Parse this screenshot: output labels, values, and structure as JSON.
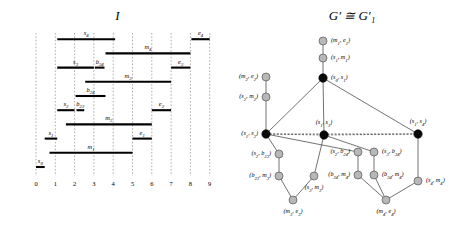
{
  "figure": {
    "interval_panel": {
      "title": "I"
    },
    "graph_panel": {
      "title": "G′ ≅ G′₁"
    }
  },
  "chart_data": {
    "type": "table",
    "xlabel": "",
    "ylabel": "",
    "grid": true,
    "axis": {
      "ticks": [
        "0",
        "1",
        "2",
        "3",
        "4",
        "5",
        "6",
        "7",
        "8",
        "9"
      ],
      "xlim": [
        0,
        9
      ]
    },
    "intervals": [
      {
        "label": "s₀",
        "start": 0.0,
        "end": 0.45,
        "row": 0
      },
      {
        "label": "m₁",
        "start": 0.7,
        "end": 5.0,
        "row": 1
      },
      {
        "label": "s₁",
        "start": 0.45,
        "end": 1.1,
        "row": 2
      },
      {
        "label": "e₁",
        "start": 5.0,
        "end": 6.0,
        "row": 2
      },
      {
        "label": "m₂",
        "start": 1.55,
        "end": 6.0,
        "row": 3
      },
      {
        "label": "s₂",
        "start": 1.1,
        "end": 2.0,
        "row": 4
      },
      {
        "label": "b₂₃",
        "start": 2.1,
        "end": 2.5,
        "row": 4
      },
      {
        "label": "e₂",
        "start": 6.0,
        "end": 7.0,
        "row": 4
      },
      {
        "label": "b₂₄",
        "start": 2.05,
        "end": 3.6,
        "row": 5
      },
      {
        "label": "m₃",
        "start": 2.55,
        "end": 7.0,
        "row": 6
      },
      {
        "label": "s₃",
        "start": 1.1,
        "end": 3.0,
        "row": 7
      },
      {
        "label": "b₃₄",
        "start": 3.05,
        "end": 3.55,
        "row": 7
      },
      {
        "label": "e₃",
        "start": 7.0,
        "end": 8.0,
        "row": 7
      },
      {
        "label": "m₄",
        "start": 3.6,
        "end": 8.0,
        "row": 8
      },
      {
        "label": "s₄",
        "start": 1.1,
        "end": 4.1,
        "row": 9
      },
      {
        "label": "e₄",
        "start": 8.05,
        "end": 9.0,
        "row": 9
      }
    ],
    "nodes": [
      {
        "id": "s0s1",
        "label": "(s₀, s₁)",
        "kind": "black",
        "x": 88,
        "y": 78,
        "label_pos": "right"
      },
      {
        "id": "s1m1",
        "label": "(s₁, m₁)",
        "kind": "gray",
        "x": 88,
        "y": 58,
        "label_pos": "right"
      },
      {
        "id": "m1e1",
        "label": "(m₁, e₁)",
        "kind": "gray",
        "x": 88,
        "y": 41,
        "label_pos": "right"
      },
      {
        "id": "s1s2",
        "label": "(s₁, s₂)",
        "kind": "black",
        "x": 31,
        "y": 134,
        "label_pos": "left"
      },
      {
        "id": "s2m2",
        "label": "(s₂, m₂)",
        "kind": "gray",
        "x": 31,
        "y": 97,
        "label_pos": "left"
      },
      {
        "id": "m2e2",
        "label": "(m₂, e₂)",
        "kind": "gray",
        "x": 31,
        "y": 77,
        "label_pos": "left"
      },
      {
        "id": "s1s3",
        "label": "(s₁, s₃)",
        "kind": "black",
        "x": 89,
        "y": 135,
        "label_pos": "above"
      },
      {
        "id": "s1s4",
        "label": "(s₁, s₄)",
        "kind": "black",
        "x": 183,
        "y": 134,
        "label_pos": "above"
      },
      {
        "id": "s2b23",
        "label": "(s₂, b₂₃)",
        "kind": "gray",
        "x": 44,
        "y": 154,
        "label_pos": "left"
      },
      {
        "id": "b23m3",
        "label": "(b₂₃, m₃)",
        "kind": "gray",
        "x": 44,
        "y": 176,
        "label_pos": "left"
      },
      {
        "id": "s3m3",
        "label": "(s₃, m₃)",
        "kind": "gray",
        "x": 79,
        "y": 176,
        "label_pos": "below"
      },
      {
        "id": "m3e3",
        "label": "(m₃, e₃)",
        "kind": "gray",
        "x": 58,
        "y": 200,
        "label_pos": "below"
      },
      {
        "id": "s2b24",
        "label": "(s₂, b₂₄)",
        "kind": "gray",
        "x": 123,
        "y": 152,
        "label_pos": "left"
      },
      {
        "id": "b24m4",
        "label": "(b₂₄, m₄)",
        "kind": "gray",
        "x": 123,
        "y": 175,
        "label_pos": "left"
      },
      {
        "id": "s3b34",
        "label": "(s₃, b₃₄)",
        "kind": "gray",
        "x": 139,
        "y": 152,
        "label_pos": "right"
      },
      {
        "id": "b34m4",
        "label": "(b₃₄, m₄)",
        "kind": "gray",
        "x": 139,
        "y": 175,
        "label_pos": "right"
      },
      {
        "id": "m4e4",
        "label": "(m₄, e₄)",
        "kind": "gray",
        "x": 151,
        "y": 200,
        "label_pos": "below"
      },
      {
        "id": "s4m4",
        "label": "(s₄, m₄)",
        "kind": "gray",
        "x": 183,
        "y": 181,
        "label_pos": "right"
      }
    ],
    "edges": [
      {
        "from": "m1e1",
        "to": "s1m1",
        "style": "solid"
      },
      {
        "from": "s1m1",
        "to": "s0s1",
        "style": "solid"
      },
      {
        "from": "s0s1",
        "to": "s1s2",
        "style": "solid"
      },
      {
        "from": "s0s1",
        "to": "s1s3",
        "style": "solid"
      },
      {
        "from": "s0s1",
        "to": "s1s4",
        "style": "solid"
      },
      {
        "from": "m2e2",
        "to": "s2m2",
        "style": "solid"
      },
      {
        "from": "s2m2",
        "to": "s1s2",
        "style": "solid"
      },
      {
        "from": "s1s2",
        "to": "s1s3",
        "style": "dashed"
      },
      {
        "from": "s1s3",
        "to": "s1s4",
        "style": "dashed"
      },
      {
        "from": "s1s2",
        "to": "s1s4",
        "style": "dashed"
      },
      {
        "from": "s1s2",
        "to": "s2b23",
        "style": "solid"
      },
      {
        "from": "s2b23",
        "to": "b23m3",
        "style": "solid"
      },
      {
        "from": "b23m3",
        "to": "m3e3",
        "style": "solid"
      },
      {
        "from": "s3m3",
        "to": "m3e3",
        "style": "solid"
      },
      {
        "from": "s1s3",
        "to": "s3m3",
        "style": "solid"
      },
      {
        "from": "s1s2",
        "to": "s2b24",
        "style": "solid"
      },
      {
        "from": "s2b24",
        "to": "b24m4",
        "style": "solid"
      },
      {
        "from": "b24m4",
        "to": "m4e4",
        "style": "solid"
      },
      {
        "from": "s1s3",
        "to": "s3b34",
        "style": "solid"
      },
      {
        "from": "s3b34",
        "to": "b34m4",
        "style": "solid"
      },
      {
        "from": "b34m4",
        "to": "m4e4",
        "style": "solid"
      },
      {
        "from": "s1s4",
        "to": "s4m4",
        "style": "solid"
      },
      {
        "from": "s4m4",
        "to": "m4e4",
        "style": "solid"
      }
    ]
  }
}
